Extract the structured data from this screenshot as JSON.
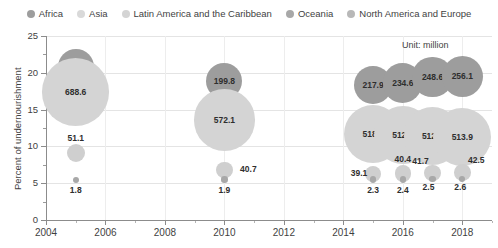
{
  "chart_data": {
    "type": "scatter",
    "title": "",
    "xlabel": "",
    "ylabel": "Percent of undernourishment",
    "annotation": "Unit: million",
    "xlim": [
      2004,
      2019
    ],
    "ylim": [
      0,
      25
    ],
    "xticks": [
      "2004",
      "2006",
      "2008",
      "2010",
      "2012",
      "2014",
      "2016",
      "2018"
    ],
    "yticks": [
      "0",
      "5",
      "10",
      "15",
      "20",
      "25"
    ],
    "grid": "horizontal and vertical",
    "legend_position": "top-center",
    "bubble_size_meaning": "number of undernourished people (million)",
    "series": [
      {
        "name": "Africa",
        "color": "#9d9d9d",
        "points": [
          {
            "x": 2005,
            "y": 20.8,
            "value": 196.0,
            "label": "196.0"
          },
          {
            "x": 2010,
            "y": 18.9,
            "value": 199.8,
            "label": "199.8"
          },
          {
            "x": 2015,
            "y": 18.3,
            "value": 217.9,
            "label": "217.9"
          },
          {
            "x": 2016,
            "y": 18.6,
            "value": 234.6,
            "label": "234.6"
          },
          {
            "x": 2017,
            "y": 19.4,
            "value": 248.6,
            "label": "248.6"
          },
          {
            "x": 2018,
            "y": 19.5,
            "value": 256.1,
            "label": "256.1"
          }
        ]
      },
      {
        "name": "Asia",
        "color": "#d4d4d4",
        "points": [
          {
            "x": 2005,
            "y": 17.4,
            "value": 688.6,
            "label": "688.6"
          },
          {
            "x": 2010,
            "y": 13.6,
            "value": 572.1,
            "label": "572.1"
          },
          {
            "x": 2015,
            "y": 11.7,
            "value": 518.7,
            "label": "518.7"
          },
          {
            "x": 2016,
            "y": 11.5,
            "value": 512.3,
            "label": "512.3"
          },
          {
            "x": 2017,
            "y": 11.4,
            "value": 512.4,
            "label": "512.4"
          },
          {
            "x": 2018,
            "y": 11.3,
            "value": 513.9,
            "label": "513.9"
          }
        ]
      },
      {
        "name": "Latin America and the Caribbean",
        "color": "#cfcfcf",
        "points": [
          {
            "x": 2005,
            "y": 9.1,
            "value": 51.1,
            "label": "51.1"
          },
          {
            "x": 2010,
            "y": 6.8,
            "value": 40.7,
            "label": "40.7"
          },
          {
            "x": 2015,
            "y": 6.2,
            "value": 39.1,
            "label": "39.1"
          },
          {
            "x": 2016,
            "y": 6.3,
            "value": 40.4,
            "label": "40.4"
          },
          {
            "x": 2017,
            "y": 6.4,
            "value": 41.7,
            "label": "41.7"
          },
          {
            "x": 2018,
            "y": 6.5,
            "value": 42.5,
            "label": "42.5"
          }
        ]
      },
      {
        "name": "Oceania",
        "color": "#a8a8a8",
        "points": [
          {
            "x": 2005,
            "y": 5.4,
            "value": 1.8,
            "label": "1.8"
          },
          {
            "x": 2010,
            "y": 5.5,
            "value": 1.9,
            "label": "1.9"
          },
          {
            "x": 2015,
            "y": 5.5,
            "value": 2.3,
            "label": "2.3"
          },
          {
            "x": 2016,
            "y": 5.5,
            "value": 2.4,
            "label": "2.4"
          },
          {
            "x": 2017,
            "y": 5.6,
            "value": 2.5,
            "label": "2.5"
          },
          {
            "x": 2018,
            "y": 5.6,
            "value": 2.6,
            "label": "2.6"
          }
        ]
      },
      {
        "name": "North America and Europe",
        "color": "#b5b5b5",
        "points": []
      }
    ]
  },
  "legend": {
    "items": [
      {
        "label": "Africa",
        "color": "#9d9d9d"
      },
      {
        "label": "Asia",
        "color": "#d9d9d9"
      },
      {
        "label": "Latin America and the Caribbean",
        "color": "#d4d4d4"
      },
      {
        "label": "Oceania",
        "color": "#a8a8a8"
      },
      {
        "label": "North America and Europe",
        "color": "#b8b8b8"
      }
    ]
  },
  "axes": {
    "ylabel": "Percent of undernourishment",
    "yticks": [
      "25",
      "20",
      "15",
      "10",
      "5",
      "0"
    ],
    "xticks": [
      "2004",
      "2006",
      "2008",
      "2010",
      "2012",
      "2014",
      "2016",
      "2018"
    ],
    "annotation": "Unit: million"
  }
}
